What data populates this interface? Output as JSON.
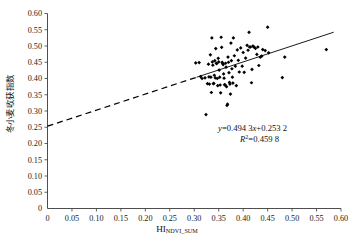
{
  "chart_data": {
    "type": "scatter",
    "title": "",
    "xlabel": "HI",
    "xlabel_sub": "NDVI_SUM",
    "ylabel": "冬小麦收获指数",
    "xlim": [
      0,
      0.6
    ],
    "ylim": [
      0,
      0.6
    ],
    "xticks": [
      "0",
      "0.05",
      "0.10",
      "0.15",
      "0.20",
      "0.25",
      "0.30",
      "0.35",
      "0.40",
      "0.45",
      "0.50",
      "0.55",
      "0.60"
    ],
    "xtick_values": [
      0,
      0.05,
      0.1,
      0.15,
      0.2,
      0.25,
      0.3,
      0.35,
      0.4,
      0.45,
      0.5,
      0.55,
      0.6
    ],
    "yticks": [
      "0",
      "0.05",
      "0.10",
      "0.15",
      "0.20",
      "0.25",
      "0.30",
      "0.35",
      "0.40",
      "0.45",
      "0.50",
      "0.55",
      "0.60"
    ],
    "ytick_values": [
      0,
      0.05,
      0.1,
      0.15,
      0.2,
      0.25,
      0.3,
      0.35,
      0.4,
      0.45,
      0.5,
      0.55,
      0.6
    ],
    "grid": false,
    "legend": "none",
    "marker_color": "#000000",
    "annotations": {
      "equation": "y=0.494 3x+0.253 2",
      "equation_y": "y",
      "equation_rest": "=0.494 3",
      "equation_x": "x",
      "equation_tail": "+0.253 2",
      "r_squared_sym": "R",
      "r_squared_exp": "2",
      "r_squared_val": "=0.459 8",
      "r_squared": "R²=0.459 8"
    },
    "fit": {
      "slope": 0.4943,
      "intercept": 0.2532,
      "r2": 0.4598,
      "solid_x_start": 0.305,
      "solid_x_end": 0.585,
      "dashed_x_start": 0.0,
      "dashed_x_end": 0.305
    },
    "points": [
      [
        0.303,
        0.448
      ],
      [
        0.31,
        0.449
      ],
      [
        0.313,
        0.406
      ],
      [
        0.316,
        0.4
      ],
      [
        0.322,
        0.402
      ],
      [
        0.324,
        0.289
      ],
      [
        0.327,
        0.384
      ],
      [
        0.329,
        0.444
      ],
      [
        0.33,
        0.405
      ],
      [
        0.331,
        0.383
      ],
      [
        0.333,
        0.473
      ],
      [
        0.334,
        0.404
      ],
      [
        0.335,
        0.357
      ],
      [
        0.336,
        0.525
      ],
      [
        0.337,
        0.451
      ],
      [
        0.338,
        0.441
      ],
      [
        0.339,
        0.384
      ],
      [
        0.34,
        0.385
      ],
      [
        0.341,
        0.41
      ],
      [
        0.342,
        0.455
      ],
      [
        0.343,
        0.402
      ],
      [
        0.344,
        0.492
      ],
      [
        0.345,
        0.447
      ],
      [
        0.346,
        0.446
      ],
      [
        0.347,
        0.4
      ],
      [
        0.348,
        0.378
      ],
      [
        0.349,
        0.462
      ],
      [
        0.35,
        0.451
      ],
      [
        0.351,
        0.426
      ],
      [
        0.352,
        0.404
      ],
      [
        0.353,
        0.38
      ],
      [
        0.354,
        0.356
      ],
      [
        0.355,
        0.527
      ],
      [
        0.356,
        0.496
      ],
      [
        0.357,
        0.45
      ],
      [
        0.358,
        0.447
      ],
      [
        0.359,
        0.443
      ],
      [
        0.36,
        0.414
      ],
      [
        0.361,
        0.401
      ],
      [
        0.362,
        0.381
      ],
      [
        0.363,
        0.38
      ],
      [
        0.364,
        0.447
      ],
      [
        0.365,
        0.435
      ],
      [
        0.366,
        0.375
      ],
      [
        0.367,
        0.317
      ],
      [
        0.368,
        0.321
      ],
      [
        0.369,
        0.466
      ],
      [
        0.37,
        0.45
      ],
      [
        0.371,
        0.418
      ],
      [
        0.372,
        0.388
      ],
      [
        0.373,
        0.383
      ],
      [
        0.374,
        0.352
      ],
      [
        0.375,
        0.509
      ],
      [
        0.376,
        0.455
      ],
      [
        0.377,
        0.43
      ],
      [
        0.378,
        0.404
      ],
      [
        0.379,
        0.386
      ],
      [
        0.38,
        0.525
      ],
      [
        0.382,
        0.47
      ],
      [
        0.384,
        0.438
      ],
      [
        0.386,
        0.378
      ],
      [
        0.388,
        0.488
      ],
      [
        0.39,
        0.456
      ],
      [
        0.392,
        0.42
      ],
      [
        0.395,
        0.494
      ],
      [
        0.398,
        0.438
      ],
      [
        0.4,
        0.48
      ],
      [
        0.402,
        0.419
      ],
      [
        0.405,
        0.463
      ],
      [
        0.408,
        0.502
      ],
      [
        0.41,
        0.487
      ],
      [
        0.412,
        0.542
      ],
      [
        0.413,
        0.497
      ],
      [
        0.415,
        0.497
      ],
      [
        0.417,
        0.387
      ],
      [
        0.418,
        0.428
      ],
      [
        0.42,
        0.5
      ],
      [
        0.422,
        0.497
      ],
      [
        0.425,
        0.493
      ],
      [
        0.428,
        0.474
      ],
      [
        0.43,
        0.497
      ],
      [
        0.432,
        0.44
      ],
      [
        0.435,
        0.466
      ],
      [
        0.438,
        0.469
      ],
      [
        0.44,
        0.489
      ],
      [
        0.445,
        0.486
      ],
      [
        0.45,
        0.558
      ],
      [
        0.452,
        0.479
      ],
      [
        0.48,
        0.403
      ],
      [
        0.485,
        0.466
      ],
      [
        0.57,
        0.489
      ]
    ]
  }
}
